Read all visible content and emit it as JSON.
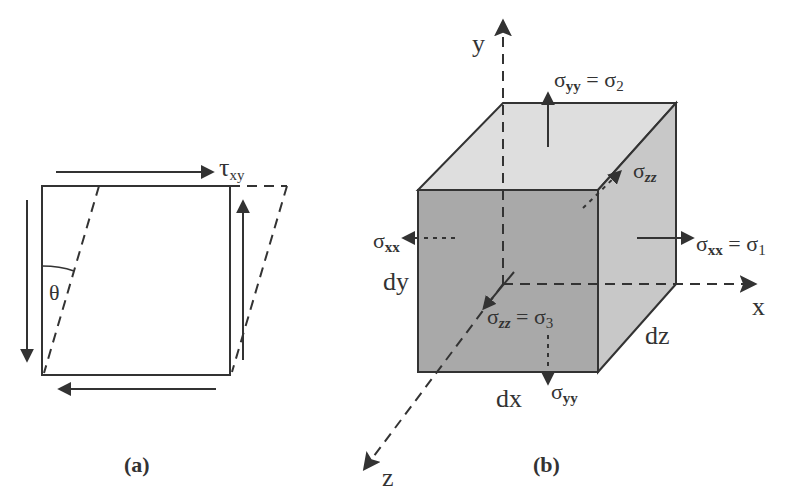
{
  "figure_a": {
    "caption": "(a)",
    "shear_label_main": "τ",
    "shear_label_sub": "xy",
    "angle_label": "θ"
  },
  "figure_b": {
    "caption": "(b)",
    "axes": {
      "x": "x",
      "y": "y",
      "z": "z"
    },
    "dims": {
      "dx": "dx",
      "dy": "dy",
      "dz": "dz"
    },
    "stresses": {
      "syy_top": {
        "sym": "σ",
        "sub": "yy",
        "eq": " = σ",
        "eq_sub": "2"
      },
      "szz_back": {
        "sym": "σ",
        "sub": "zz"
      },
      "sxx_left": {
        "sym": "σ",
        "sub": "xx"
      },
      "sxx_right": {
        "sym": "σ",
        "sub": "xx",
        "eq": " = σ",
        "eq_sub": "1"
      },
      "szz_front": {
        "sym": "σ",
        "sub": "zz",
        "eq": " = σ",
        "eq_sub": "3"
      },
      "syy_bottom": {
        "sym": "σ",
        "sub": "yy"
      }
    },
    "colors": {
      "top_face": "#dedede",
      "front_face": "#a9a9a9",
      "right_face": "#c8c8c8",
      "stroke": "#333333"
    }
  }
}
